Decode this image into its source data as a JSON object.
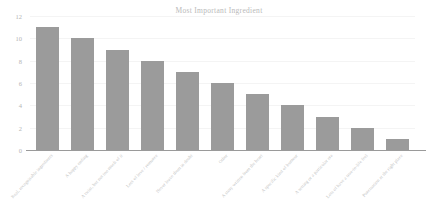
{
  "chart_data": {
    "type": "bar",
    "title": "Most Important Ingredient",
    "xlabel": "",
    "ylabel": "",
    "ylim": [
      0,
      12
    ],
    "yticks": [
      0,
      2,
      4,
      6,
      8,
      10,
      12
    ],
    "grid": true,
    "legend": false,
    "orientation": "vertical",
    "bar_color": "#9b9b9b",
    "categories": [
      "Real, recognisable ingredients",
      "A happy ending",
      "A twist, but not too much of it",
      "Lots of love / romance",
      "Never leave them in doubt",
      "Other",
      "A story written from the heart",
      "A specific kind of humour",
      "A setting or a particular era",
      "Lots of have a true-to-life feel",
      "Punctuation at the right place"
    ],
    "values": [
      11,
      10,
      9,
      8,
      7,
      6,
      5,
      4,
      3,
      2,
      1
    ]
  },
  "colors": {
    "bar": "#9b9b9b",
    "axis": "#9a9a9a",
    "grid": "#f4f4f4",
    "text": "#b9b9b9",
    "background": "#ffffff"
  }
}
